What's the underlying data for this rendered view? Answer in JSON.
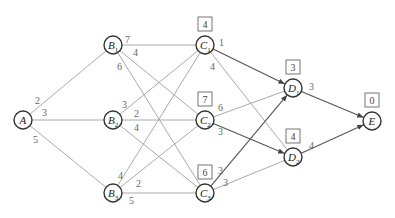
{
  "diagram": {
    "type": "weighted-directed-graph",
    "nodes": [
      {
        "id": "A",
        "label": "A",
        "sub": "",
        "x": 23,
        "y": 120
      },
      {
        "id": "B1",
        "label": "B",
        "sub": "1",
        "x": 113,
        "y": 45
      },
      {
        "id": "B2",
        "label": "B",
        "sub": "2",
        "x": 113,
        "y": 120
      },
      {
        "id": "B3",
        "label": "B",
        "sub": "3",
        "x": 113,
        "y": 193
      },
      {
        "id": "C1",
        "label": "C",
        "sub": "1",
        "x": 205,
        "y": 45,
        "value": "4"
      },
      {
        "id": "C2",
        "label": "C",
        "sub": "2",
        "x": 205,
        "y": 120,
        "value": "7"
      },
      {
        "id": "C3",
        "label": "C",
        "sub": "3",
        "x": 205,
        "y": 193,
        "value": "6"
      },
      {
        "id": "D1",
        "label": "D",
        "sub": "1",
        "x": 293,
        "y": 88,
        "value": "3"
      },
      {
        "id": "D2",
        "label": "D",
        "sub": "2",
        "x": 293,
        "y": 157,
        "value": "4"
      },
      {
        "id": "E",
        "label": "E",
        "sub": "",
        "x": 372,
        "y": 121,
        "value": "0"
      }
    ],
    "edges": [
      {
        "from": "A",
        "to": "B1",
        "weight": "2",
        "lx": 35,
        "ly": 104
      },
      {
        "from": "A",
        "to": "B2",
        "weight": "3",
        "lx": 42,
        "ly": 116
      },
      {
        "from": "A",
        "to": "B3",
        "weight": "5",
        "lx": 33,
        "ly": 143
      },
      {
        "from": "B1",
        "to": "C1",
        "weight": "7",
        "lx": 125,
        "ly": 43
      },
      {
        "from": "B1",
        "to": "C2",
        "weight": "4",
        "lx": 133,
        "ly": 56
      },
      {
        "from": "B1",
        "to": "C3",
        "weight": "6",
        "lx": 117,
        "ly": 70
      },
      {
        "from": "B2",
        "to": "C1",
        "weight": "3",
        "lx": 122,
        "ly": 108
      },
      {
        "from": "B2",
        "to": "C2",
        "weight": "2",
        "lx": 134,
        "ly": 117
      },
      {
        "from": "B2",
        "to": "C3",
        "weight": "4",
        "lx": 134,
        "ly": 131
      },
      {
        "from": "B3",
        "to": "C1",
        "weight": "4",
        "lx": 118,
        "ly": 179
      },
      {
        "from": "B3",
        "to": "C2",
        "weight": "2",
        "lx": 136,
        "ly": 187
      },
      {
        "from": "B3",
        "to": "C3",
        "weight": "5",
        "lx": 129,
        "ly": 204
      },
      {
        "from": "C1",
        "to": "D1",
        "weight": "1",
        "lx": 219,
        "ly": 46,
        "path": true
      },
      {
        "from": "C1",
        "to": "D2",
        "weight": "4",
        "lx": 210,
        "ly": 70
      },
      {
        "from": "C2",
        "to": "D1",
        "weight": "6",
        "lx": 218,
        "ly": 111
      },
      {
        "from": "C2",
        "to": "D2",
        "weight": "3",
        "lx": 218,
        "ly": 135,
        "path": true
      },
      {
        "from": "C3",
        "to": "D1",
        "weight": "3",
        "lx": 218,
        "ly": 174,
        "path": true
      },
      {
        "from": "C3",
        "to": "D2",
        "weight": "3",
        "lx": 223,
        "ly": 186
      },
      {
        "from": "D1",
        "to": "E",
        "weight": "3",
        "lx": 309,
        "ly": 90,
        "path": true
      },
      {
        "from": "D2",
        "to": "E",
        "weight": "4",
        "lx": 309,
        "ly": 149,
        "path": true
      }
    ]
  }
}
